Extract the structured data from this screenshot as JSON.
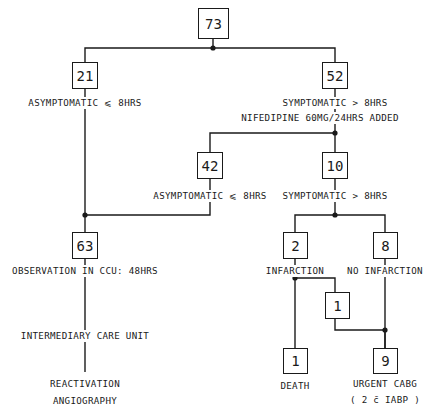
{
  "diagram": {
    "stroke_color": "#1a1a1a",
    "background_color": "#ffffff",
    "nodes": [
      {
        "id": "n73",
        "value": "73",
        "x": 198,
        "y": 8,
        "w": 31,
        "h": 31
      },
      {
        "id": "n21",
        "value": "21",
        "x": 72,
        "y": 62,
        "w": 26,
        "h": 27
      },
      {
        "id": "n52",
        "value": "52",
        "x": 322,
        "y": 62,
        "w": 26,
        "h": 27
      },
      {
        "id": "n42",
        "value": "42",
        "x": 197,
        "y": 152,
        "w": 26,
        "h": 27
      },
      {
        "id": "n10",
        "value": "10",
        "x": 322,
        "y": 152,
        "w": 26,
        "h": 27
      },
      {
        "id": "n63",
        "value": "63",
        "x": 72,
        "y": 232,
        "w": 26,
        "h": 27
      },
      {
        "id": "n2",
        "value": "2",
        "x": 283,
        "y": 232,
        "w": 25,
        "h": 27
      },
      {
        "id": "n8",
        "value": "8",
        "x": 373,
        "y": 232,
        "w": 25,
        "h": 27
      },
      {
        "id": "n1m",
        "value": "1",
        "x": 325,
        "y": 292,
        "w": 25,
        "h": 27
      },
      {
        "id": "n1d",
        "value": "1",
        "x": 283,
        "y": 348,
        "w": 25,
        "h": 26
      },
      {
        "id": "n9",
        "value": "9",
        "x": 373,
        "y": 348,
        "w": 25,
        "h": 26
      }
    ],
    "labels": [
      {
        "id": "lbl-asymptomatic-top",
        "text": "ASYMPTOMATIC ⩽ 8HRS",
        "x": 85,
        "y": 97
      },
      {
        "id": "lbl-symptomatic-top",
        "text": "SYMPTOMATIC > 8HRS",
        "x": 335,
        "y": 97
      },
      {
        "id": "lbl-nifedipine",
        "text": "NIFEDIPINE 60MG/24HRS ADDED",
        "x": 320,
        "y": 112
      },
      {
        "id": "lbl-asymptomatic-mid",
        "text": "ASYMPTOMATIC ⩽ 8HRS",
        "x": 210,
        "y": 190
      },
      {
        "id": "lbl-symptomatic-mid",
        "text": "SYMPTOMATIC > 8HRS",
        "x": 335,
        "y": 190
      },
      {
        "id": "lbl-observation",
        "text": "OBSERVATION IN CCU: 48HRS",
        "x": 85,
        "y": 265
      },
      {
        "id": "lbl-infarction",
        "text": "INFARCTION",
        "x": 295,
        "y": 265
      },
      {
        "id": "lbl-no-infarction",
        "text": "NO INFARCTION",
        "x": 385,
        "y": 265
      },
      {
        "id": "lbl-intermediary-care",
        "text": "INTERMEDIARY CARE UNIT",
        "x": 85,
        "y": 330
      },
      {
        "id": "lbl-death",
        "text": "DEATH",
        "x": 295,
        "y": 380
      },
      {
        "id": "lbl-reactivation",
        "text": "REACTIVATION",
        "x": 85,
        "y": 378
      },
      {
        "id": "lbl-angiography",
        "text": "ANGIOGRAPHY",
        "x": 85,
        "y": 395
      },
      {
        "id": "lbl-urgent-cabg",
        "text": "URGENT CABG",
        "x": 385,
        "y": 378
      },
      {
        "id": "lbl-iabp",
        "text": "( 2 c̄ IABP )",
        "x": 385,
        "y": 394
      }
    ],
    "edges": [
      {
        "id": "e-73-split",
        "from": "n73",
        "to": "n21/n52",
        "points": "213,39 213,48 85,48 85,62"
      },
      {
        "id": "e-73-right",
        "from": "n73",
        "to": "n52",
        "points": "213,48 335,48 335,62"
      },
      {
        "id": "e-21-down",
        "from": "n21",
        "to": "n63",
        "points": "85,89 85,232"
      },
      {
        "id": "e-52-down",
        "from": "n52",
        "to": "split2",
        "points": "335,89 335,133"
      },
      {
        "id": "e-split2-left",
        "from": "n52",
        "to": "n42",
        "points": "335,133 210,133 210,152"
      },
      {
        "id": "e-split2-right",
        "from": "n52",
        "to": "n10",
        "points": "335,133 335,152"
      },
      {
        "id": "e-42-down",
        "from": "n42",
        "to": "n63",
        "points": "210,179 210,215 85,215"
      },
      {
        "id": "e-10-down",
        "from": "n10",
        "to": "split3",
        "points": "335,179 335,215"
      },
      {
        "id": "e-split3-left",
        "from": "n10",
        "to": "n2",
        "points": "335,215 295,215 295,232"
      },
      {
        "id": "e-split3-right",
        "from": "n10",
        "to": "n8",
        "points": "335,215 385,215 385,232"
      },
      {
        "id": "e-63-down",
        "from": "n63",
        "to": "bottom",
        "points": "85,259 85,372"
      },
      {
        "id": "e-2-down",
        "from": "n2",
        "to": "n1m",
        "points": "295,259 295,278 335,278 335,292"
      },
      {
        "id": "e-2-death",
        "from": "n2",
        "to": "n1d",
        "points": "295,278 295,348"
      },
      {
        "id": "e-1m-down",
        "from": "n1m",
        "to": "n9",
        "points": "335,319 335,330 385,330 385,348"
      },
      {
        "id": "e-8-down",
        "from": "n8",
        "to": "n9",
        "points": "385,259 385,348"
      }
    ],
    "junction_dots": [
      {
        "id": "dot-73",
        "x": 213,
        "y": 48
      },
      {
        "id": "dot-52",
        "x": 335,
        "y": 133
      },
      {
        "id": "dot-63",
        "x": 85,
        "y": 215
      },
      {
        "id": "dot-10",
        "x": 335,
        "y": 215
      },
      {
        "id": "dot-2",
        "x": 295,
        "y": 278
      },
      {
        "id": "dot-9",
        "x": 385,
        "y": 330
      }
    ]
  }
}
